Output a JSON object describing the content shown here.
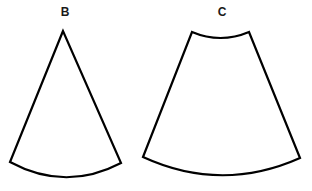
{
  "figure": {
    "background_color": "#ffffff",
    "stroke_color": "#000000",
    "fill_color": "#ffffff",
    "stroke_width": 2.2,
    "canvas": {
      "width": 312,
      "height": 191
    }
  },
  "shapes": [
    {
      "id": "B",
      "label": "B",
      "kind": "circular-sector",
      "description": "Circular sector with sharp apex at top and convex arc at bottom",
      "apex": {
        "x": 63,
        "y": 31
      },
      "left_corner": {
        "x": 10,
        "y": 162
      },
      "right_corner": {
        "x": 121,
        "y": 163
      },
      "arc_bottom_y": 180,
      "has_top_arc": false,
      "path": "M 63 31 L 10 162 Q 65.5 192 121 163 Z",
      "label_position": {
        "x": 65,
        "y": 12
      }
    },
    {
      "id": "C",
      "label": "C",
      "kind": "annular-sector",
      "description": "Truncated circular sector (frustum net) with concave arc at top and convex arc at bottom",
      "top_left_corner": {
        "x": 192,
        "y": 32
      },
      "top_right_corner": {
        "x": 249,
        "y": 32
      },
      "top_arc_dip_y": 38,
      "bottom_left_corner": {
        "x": 143,
        "y": 157
      },
      "bottom_right_corner": {
        "x": 300,
        "y": 158
      },
      "arc_bottom_y": 181,
      "has_top_arc": true,
      "path": "M 192 32 Q 220.5 44 249 32 L 300 158 Q 221.5 193 143 157 Z",
      "label_position": {
        "x": 222,
        "y": 12
      }
    }
  ],
  "labels": {
    "b": "B",
    "c": "C"
  }
}
